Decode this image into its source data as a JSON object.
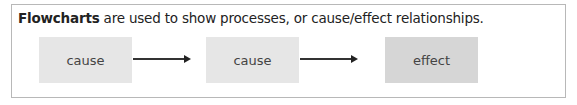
{
  "intro": {
    "bold_term": "Flowcharts",
    "rest": " are used to show processes, or cause/effect relationships."
  },
  "flowchart": {
    "nodes": [
      {
        "label": "cause",
        "shade": "#e6e6e6"
      },
      {
        "label": "cause",
        "shade": "#e6e6e6"
      },
      {
        "label": "effect",
        "shade": "#d6d6d6"
      }
    ],
    "edges": [
      {
        "from": 0,
        "to": 1,
        "type": "arrow"
      },
      {
        "from": 1,
        "to": 2,
        "type": "arrow"
      }
    ]
  }
}
